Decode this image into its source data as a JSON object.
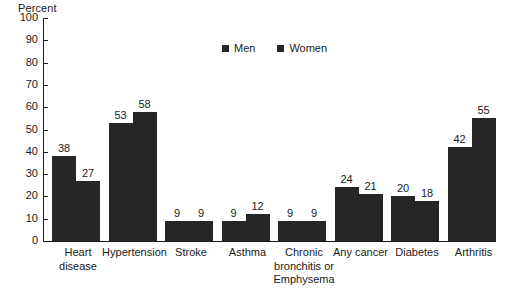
{
  "chart_data": {
    "type": "bar",
    "title": "",
    "ylabel": "Percent",
    "xlabel": "",
    "ylim": [
      0,
      100
    ],
    "yticks": [
      0,
      10,
      20,
      30,
      40,
      50,
      60,
      70,
      80,
      90,
      100
    ],
    "grid": false,
    "legend_position": "top-center",
    "bar_color": "#262626",
    "categories": [
      "Heart disease",
      "Hypertension",
      "Stroke",
      "Asthma",
      "Chronic bronchitis or Emphysema",
      "Any cancer",
      "Diabetes",
      "Arthritis"
    ],
    "category_lines": [
      [
        "Heart",
        "disease"
      ],
      [
        "Hypertension"
      ],
      [
        "Stroke"
      ],
      [
        "Asthma"
      ],
      [
        "Chronic",
        "bronchitis or",
        "Emphysema"
      ],
      [
        "Any cancer"
      ],
      [
        "Diabetes"
      ],
      [
        "Arthritis"
      ]
    ],
    "series": [
      {
        "name": "Men",
        "values": [
          38,
          53,
          9,
          9,
          9,
          24,
          20,
          42
        ]
      },
      {
        "name": "Women",
        "values": [
          27,
          58,
          9,
          12,
          9,
          21,
          18,
          55
        ]
      }
    ]
  },
  "legend": {
    "items": [
      {
        "label": "Men"
      },
      {
        "label": "Women"
      }
    ]
  },
  "axis": {
    "y_title": "Percent",
    "tick_labels": [
      "100",
      "90",
      "80",
      "70",
      "60",
      "50",
      "40",
      "30",
      "20",
      "10",
      "0"
    ]
  }
}
